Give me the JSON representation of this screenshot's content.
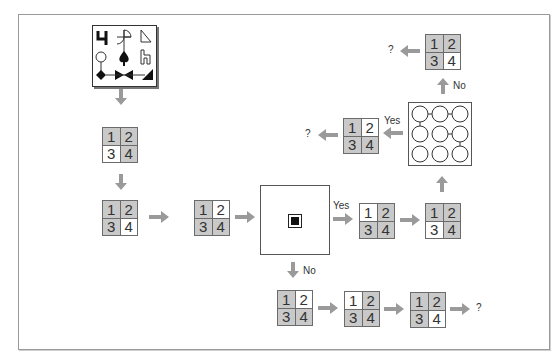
{
  "diagram": {
    "colors": {
      "shaded": "#c9c9c9",
      "unshaded": "#ffffff",
      "arrow": "#9a9a9a",
      "border": "#6b6b6b"
    },
    "cell_labels": [
      "1",
      "2",
      "3",
      "4"
    ],
    "symbol_panel": {
      "symbols": [
        "digit-four-glyph",
        "quarter-circle-cross",
        "right-triangle-outline",
        "circle-outline",
        "spade",
        "h-outline-glyph",
        "diamond",
        "bowtie",
        "filled-triangle"
      ]
    },
    "grids": [
      {
        "id": "g-left-1",
        "shade": [
          "g",
          "g",
          "w",
          "g"
        ]
      },
      {
        "id": "g-left-2",
        "shade": [
          "g",
          "g",
          "g",
          "w"
        ]
      },
      {
        "id": "g-mid-1",
        "shade": [
          "g",
          "w",
          "g",
          "g"
        ]
      },
      {
        "id": "g-yes-1",
        "shade": [
          "w",
          "g",
          "g",
          "g"
        ]
      },
      {
        "id": "g-yes-2",
        "shade": [
          "g",
          "g",
          "w",
          "g"
        ]
      },
      {
        "id": "g-upper-left",
        "shade": [
          "g",
          "w",
          "g",
          "g"
        ]
      },
      {
        "id": "g-top",
        "shade": [
          "g",
          "g",
          "g",
          "w"
        ]
      },
      {
        "id": "g-bottom-1",
        "shade": [
          "g",
          "w",
          "g",
          "g"
        ]
      },
      {
        "id": "g-bottom-2",
        "shade": [
          "w",
          "g",
          "g",
          "g"
        ]
      },
      {
        "id": "g-bottom-3",
        "shade": [
          "g",
          "g",
          "g",
          "w"
        ]
      }
    ],
    "labels": {
      "yes": "Yes",
      "no": "No",
      "question": "?"
    }
  }
}
